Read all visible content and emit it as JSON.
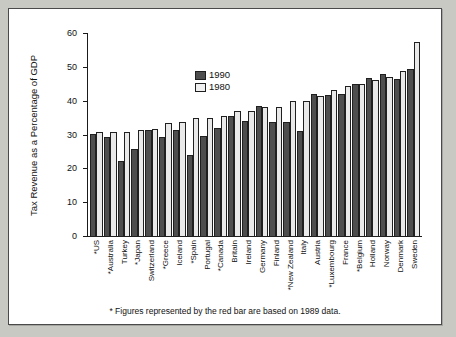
{
  "figure": {
    "footnote": "* Figures represented by the red bar are based on 1989 data."
  },
  "legend": {
    "position": "top-left-inside",
    "entries": [
      {
        "label": "1990",
        "color": "#4e4e4e"
      },
      {
        "label": "1980",
        "color": "#f0f0f0"
      }
    ]
  },
  "chart_data": {
    "type": "bar",
    "title": "",
    "subtitle": "",
    "xlabel": "",
    "ylabel": "Tax Revenue as a Percentage of GDP",
    "ylim": [
      0,
      60
    ],
    "yticks": [
      0,
      10,
      20,
      30,
      40,
      50,
      60
    ],
    "grid": false,
    "legend_position": "upper left",
    "annotations": [
      "* Figures represented by the red bar are based on 1989 data."
    ],
    "categories": [
      "*US",
      "*Australia",
      "Turkey",
      "*Japan",
      "Switzerland",
      "*Greece",
      "Iceland",
      "*Spain",
      "Portugal",
      "*Canada",
      "Britain",
      "Ireland",
      "Germany",
      "Finland",
      "*New Zealand",
      "Italy",
      "Austria",
      "*Luxembourg",
      "France",
      "*Belgium",
      "Holland",
      "Norway",
      "Denmark",
      "Sweden"
    ],
    "series": [
      {
        "name": "1990",
        "color": "#4e4e4e",
        "values": [
          30.5,
          29.5,
          22.5,
          26.1,
          31.5,
          29.7,
          31.7,
          24.3,
          29.8,
          32.2,
          35.8,
          34.3,
          38.8,
          33.9,
          33.9,
          31.4,
          42.3,
          41.9,
          42.4,
          45.2,
          47.1,
          48.1,
          46.7,
          49.8
        ],
        "note": "Bars marked with * are 1989 data"
      },
      {
        "name": "1980",
        "color": "#e9e9e9",
        "values": [
          31.0,
          31.0,
          31.0,
          31.5,
          32.0,
          33.6,
          34.1,
          35.1,
          35.1,
          35.7,
          37.2,
          37.2,
          38.3,
          38.4,
          40.3,
          40.2,
          41.8,
          43.5,
          44.6,
          45.1,
          46.5,
          47.2,
          49.2,
          57.5
        ]
      }
    ]
  }
}
